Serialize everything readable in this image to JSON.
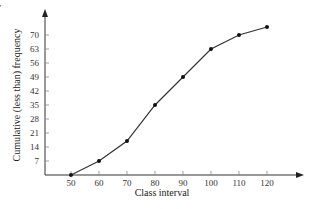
{
  "chart_data": {
    "type": "line",
    "title": "",
    "xlabel": "Class interval",
    "ylabel": "Cumulative (less than) frequency",
    "x": [
      50,
      60,
      70,
      80,
      90,
      100,
      110,
      120
    ],
    "series": [
      {
        "name": "Cumulative (less than) frequency",
        "values": [
          0,
          7,
          17,
          35,
          49,
          63,
          70,
          74
        ]
      }
    ],
    "x_ticks": [
      "50",
      "60",
      "70",
      "80",
      "90",
      "100",
      "110",
      "120"
    ],
    "y_ticks": [
      "7",
      "14",
      "21",
      "28",
      "35",
      "42",
      "49",
      "56",
      "63",
      "70"
    ],
    "ylim": [
      0,
      77
    ],
    "grid": false,
    "legend": "none",
    "markers": true,
    "line_color": "#333333"
  }
}
